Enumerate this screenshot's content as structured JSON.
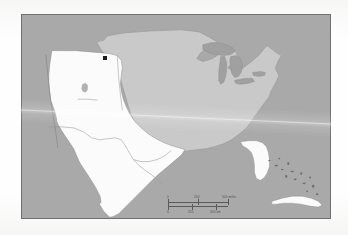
{
  "document": {
    "kind": "scanned-map-figure",
    "title": "Map of the United States and northern Mexico"
  },
  "map": {
    "name": "north-america-study-area-map",
    "frame": {
      "x": 21,
      "y": 14,
      "width": 310,
      "height": 205
    },
    "colors": {
      "ocean": "#a9a9a9",
      "other_land": "#a9a9a9",
      "shaded_region": "#c9c9c9",
      "highlight_region": "#fbfbfb",
      "border_line": "#6f6f6f",
      "state_line": "#9a9a9a",
      "marker": "#1c1c1c",
      "page": "#fdfdfd"
    },
    "regions": [
      {
        "id": "eastern-central-us",
        "label": "shaded region",
        "fill": "#c9c9c9"
      },
      {
        "id": "western-us-and-mexico",
        "label": "highlighted region",
        "fill": "#fbfbfb"
      },
      {
        "id": "ocean-and-outside",
        "label": "ocean and surrounding land",
        "fill": "#a9a9a9"
      }
    ],
    "features": [
      {
        "id": "great-lakes",
        "label": "Great Lakes"
      },
      {
        "id": "florida-peninsula",
        "label": "Florida"
      },
      {
        "id": "baja-california",
        "label": "Baja California"
      },
      {
        "id": "gulf-of-california",
        "label": "Gulf of California"
      },
      {
        "id": "gulf-of-mexico",
        "label": "Gulf of Mexico"
      },
      {
        "id": "cuba",
        "label": "Cuba"
      },
      {
        "id": "bahamas",
        "label": "Bahamas"
      },
      {
        "id": "great-salt-lake",
        "label": "Great Salt Lake"
      }
    ],
    "marker": {
      "name": "site-marker",
      "shape": "square",
      "color": "#1c1c1c",
      "x": 81,
      "y": 41
    }
  },
  "scale_bar": {
    "name": "scale-bar",
    "miles": {
      "unit": "miles",
      "ticks": [
        "0",
        "250",
        "500 miles"
      ]
    },
    "kilometers": {
      "unit": "km",
      "ticks": [
        "0",
        "250",
        "500 km"
      ]
    }
  }
}
